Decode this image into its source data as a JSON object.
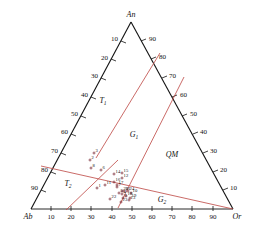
{
  "figure": {
    "type": "ternary-diagram",
    "title": "",
    "background_color": "#ffffff",
    "axis_color": "#111111",
    "boundary_color": "#c0504d",
    "point_color": "#7a2530"
  },
  "vertices": {
    "top": "An",
    "bottom_left": "Ab",
    "bottom_right": "Or"
  },
  "axes": {
    "left_edge": {
      "name": "Ab-An edge",
      "ticks": [
        "10",
        "20",
        "30",
        "40",
        "50",
        "60",
        "70",
        "80",
        "90"
      ]
    },
    "right_edge": {
      "name": "An-Or edge",
      "ticks": [
        "90",
        "80",
        "70",
        "60",
        "50",
        "40",
        "30",
        "20",
        "10"
      ]
    },
    "bottom_edge": {
      "name": "Ab-Or edge",
      "ticks": [
        "10",
        "20",
        "30",
        "40",
        "50",
        "60",
        "70",
        "80",
        "90"
      ]
    }
  },
  "regions": [
    {
      "id": "T1",
      "label": "T",
      "sub": "1"
    },
    {
      "id": "T2",
      "label": "T",
      "sub": "2"
    },
    {
      "id": "G1",
      "label": "G",
      "sub": "1"
    },
    {
      "id": "G2",
      "label": "G",
      "sub": "2"
    },
    {
      "id": "QM",
      "label": "QM",
      "sub": ""
    }
  ],
  "chart_data": {
    "type": "scatter",
    "title": "",
    "xlabel": "",
    "ylabel": "",
    "components": [
      "An",
      "Ab",
      "Or"
    ],
    "axis_min": 0,
    "axis_max": 100,
    "grid": false,
    "legend": "none",
    "series": [
      {
        "name": "samples",
        "labels": [
          "1",
          "2",
          "3",
          "4",
          "5",
          "6",
          "7",
          "8",
          "9",
          "10",
          "11",
          "12",
          "13",
          "14",
          "15",
          "16",
          "17",
          "18",
          "19",
          "20",
          "21",
          "22",
          "23",
          "24"
        ],
        "points": [
          {
            "label": "1",
            "An": 7,
            "Ab": 56,
            "Or": 37,
            "px": 97,
            "py": 188
          },
          {
            "label": "2",
            "An": 26,
            "Ab": 57,
            "Or": 17,
            "px": 90,
            "py": 160
          },
          {
            "label": "3",
            "An": 29,
            "Ab": 54,
            "Or": 17,
            "px": 94,
            "py": 153
          },
          {
            "label": "4",
            "An": 9,
            "Ab": 48,
            "Or": 43,
            "px": 122,
            "py": 194
          },
          {
            "label": "5",
            "An": 9,
            "Ab": 49,
            "Or": 42,
            "px": 119,
            "py": 193
          },
          {
            "label": "6",
            "An": 21,
            "Ab": 54,
            "Or": 25,
            "px": 101,
            "py": 170
          },
          {
            "label": "7",
            "An": 11,
            "Ab": 50,
            "Or": 39,
            "px": 117,
            "py": 187
          },
          {
            "label": "8",
            "An": 22,
            "Ab": 61,
            "Or": 17,
            "px": 91,
            "py": 168
          },
          {
            "label": "9",
            "An": 7,
            "Ab": 50,
            "Or": 43,
            "px": 123,
            "py": 198
          },
          {
            "label": "10",
            "An": 8,
            "Ab": 45,
            "Or": 47,
            "px": 131,
            "py": 193
          },
          {
            "label": "11",
            "An": 12,
            "Ab": 54,
            "Or": 34,
            "px": 105,
            "py": 185
          },
          {
            "label": "12",
            "An": 16,
            "Ab": 48,
            "Or": 36,
            "px": 122,
            "py": 178
          },
          {
            "label": "13",
            "An": 6,
            "Ab": 46,
            "Or": 48,
            "px": 129,
            "py": 200
          },
          {
            "label": "14",
            "An": 18,
            "Ab": 50,
            "Or": 32,
            "px": 114,
            "py": 174
          },
          {
            "label": "15",
            "An": 18,
            "Ab": 47,
            "Or": 35,
            "px": 122,
            "py": 173
          },
          {
            "label": "16",
            "An": 13,
            "Ab": 51,
            "Or": 36,
            "px": 114,
            "py": 182
          },
          {
            "label": "17",
            "An": 12,
            "Ab": 50,
            "Or": 38,
            "px": 117,
            "py": 185
          },
          {
            "label": "18",
            "An": 8,
            "Ab": 47,
            "Or": 45,
            "px": 126,
            "py": 196
          },
          {
            "label": "19",
            "An": 7,
            "Ab": 45,
            "Or": 48,
            "px": 130,
            "py": 198
          },
          {
            "label": "20",
            "An": 9,
            "Ab": 48,
            "Or": 43,
            "px": 122,
            "py": 191
          },
          {
            "label": "21",
            "An": 9,
            "Ab": 47,
            "Or": 44,
            "px": 124,
            "py": 191
          },
          {
            "label": "22",
            "An": 6,
            "Ab": 53,
            "Or": 41,
            "px": 110,
            "py": 199
          },
          {
            "label": "23",
            "An": 5,
            "Ab": 49,
            "Or": 46,
            "px": 121,
            "py": 202
          },
          {
            "label": "24",
            "An": 9,
            "Ab": 45,
            "Or": 46,
            "px": 128,
            "py": 191
          }
        ]
      }
    ],
    "boundaries": [
      {
        "name": "G1-T1 boundary",
        "from_px": [
          96,
          158
        ],
        "to_px": [
          160,
          53
        ]
      },
      {
        "name": "G1-QM boundary",
        "from_px": [
          118,
          208
        ],
        "to_px": [
          184,
          77
        ]
      },
      {
        "name": "T2-T1 boundary",
        "from_px": [
          41,
          166
        ],
        "to_px": [
          233,
          209
        ]
      },
      {
        "name": "G2-lower boundary",
        "from_px": [
          66,
          210
        ],
        "to_px": [
          118,
          160
        ]
      }
    ]
  }
}
